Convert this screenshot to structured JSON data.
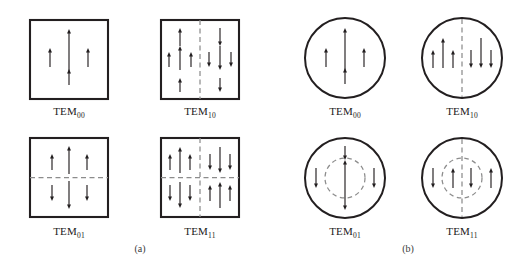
{
  "figure": {
    "panels": [
      {
        "id": "panel-a",
        "caption": "(a)",
        "caption_x": 140,
        "caption_y": 252,
        "aperture": "square",
        "cells": [
          {
            "id": "sq-tem00",
            "label_main": "TEM",
            "label_sub": "00",
            "label_x": 69,
            "label_y": 115,
            "shape": {
              "type": "rect",
              "x": 30,
              "y": 20,
              "w": 78,
              "h": 79
            },
            "nodal_lines": [],
            "nodal_circles": [],
            "arrows": [
              {
                "x": 69,
                "y1": 85,
                "y2": 69,
                "dir": "up",
                "len": 16
              },
              {
                "x": 69,
                "y1": 71,
                "y2": 29,
                "dir": "up",
                "len": 42
              },
              {
                "x": 50,
                "y1": 67,
                "y2": 48,
                "dir": "up",
                "len": 19
              },
              {
                "x": 88,
                "y1": 67,
                "y2": 48,
                "dir": "up",
                "len": 19
              }
            ]
          },
          {
            "id": "sq-tem10",
            "label_main": "TEM",
            "label_sub": "10",
            "label_x": 200,
            "label_y": 115,
            "shape": {
              "type": "rect",
              "x": 161,
              "y": 20,
              "w": 78,
              "h": 79
            },
            "nodal_lines": [
              {
                "orientation": "vertical",
                "x1": 200,
                "y1": 20,
                "x2": 200,
                "y2": 99
              }
            ],
            "nodal_circles": [],
            "arrows": [
              {
                "x": 180,
                "y1": 46,
                "y2": 28,
                "dir": "up",
                "len": 18
              },
              {
                "x": 180,
                "y1": 70,
                "y2": 46,
                "dir": "up",
                "len": 24
              },
              {
                "x": 180,
                "y1": 92,
                "y2": 78,
                "dir": "up",
                "len": 14
              },
              {
                "x": 169,
                "y1": 67,
                "y2": 52,
                "dir": "up",
                "len": 15
              },
              {
                "x": 191,
                "y1": 67,
                "y2": 52,
                "dir": "up",
                "len": 15
              },
              {
                "x": 220,
                "y1": 28,
                "y2": 46,
                "dir": "down",
                "len": 18
              },
              {
                "x": 220,
                "y1": 46,
                "y2": 70,
                "dir": "down",
                "len": 24
              },
              {
                "x": 220,
                "y1": 78,
                "y2": 92,
                "dir": "down",
                "len": 14
              },
              {
                "x": 209,
                "y1": 52,
                "y2": 67,
                "dir": "down",
                "len": 15
              },
              {
                "x": 231,
                "y1": 52,
                "y2": 67,
                "dir": "down",
                "len": 15
              }
            ]
          },
          {
            "id": "sq-tem01",
            "label_main": "TEM",
            "label_sub": "01",
            "label_x": 69,
            "label_y": 235,
            "shape": {
              "type": "rect",
              "x": 30,
              "y": 138,
              "w": 78,
              "h": 79
            },
            "nodal_lines": [
              {
                "orientation": "horizontal",
                "x1": 30,
                "y1": 177.5,
                "x2": 108,
                "y2": 177.5
              }
            ],
            "nodal_circles": [],
            "arrows": [
              {
                "x": 69,
                "y1": 174,
                "y2": 146,
                "dir": "up",
                "len": 28
              },
              {
                "x": 52,
                "y1": 170,
                "y2": 154,
                "dir": "up",
                "len": 16
              },
              {
                "x": 87,
                "y1": 170,
                "y2": 154,
                "dir": "up",
                "len": 16
              },
              {
                "x": 69,
                "y1": 181,
                "y2": 209,
                "dir": "down",
                "len": 28
              },
              {
                "x": 52,
                "y1": 185,
                "y2": 201,
                "dir": "down",
                "len": 16
              },
              {
                "x": 87,
                "y1": 185,
                "y2": 201,
                "dir": "down",
                "len": 16
              }
            ]
          },
          {
            "id": "sq-tem11",
            "label_main": "TEM",
            "label_sub": "11",
            "label_x": 200,
            "label_y": 235,
            "shape": {
              "type": "rect",
              "x": 161,
              "y": 138,
              "w": 78,
              "h": 79
            },
            "nodal_lines": [
              {
                "orientation": "horizontal",
                "x1": 161,
                "y1": 177.5,
                "x2": 239,
                "y2": 177.5
              },
              {
                "orientation": "vertical",
                "x1": 200,
                "y1": 138,
                "x2": 200,
                "y2": 217
              }
            ],
            "nodal_circles": [],
            "arrows": [
              {
                "x": 180,
                "y1": 173,
                "y2": 147,
                "dir": "up",
                "len": 26
              },
              {
                "x": 170,
                "y1": 170,
                "y2": 154,
                "dir": "up",
                "len": 16
              },
              {
                "x": 190,
                "y1": 170,
                "y2": 154,
                "dir": "up",
                "len": 16
              },
              {
                "x": 220,
                "y1": 147,
                "y2": 173,
                "dir": "down",
                "len": 26
              },
              {
                "x": 210,
                "y1": 154,
                "y2": 170,
                "dir": "down",
                "len": 16
              },
              {
                "x": 230,
                "y1": 154,
                "y2": 170,
                "dir": "down",
                "len": 16
              },
              {
                "x": 180,
                "y1": 182,
                "y2": 208,
                "dir": "down",
                "len": 26
              },
              {
                "x": 170,
                "y1": 185,
                "y2": 201,
                "dir": "down",
                "len": 16
              },
              {
                "x": 190,
                "y1": 185,
                "y2": 201,
                "dir": "down",
                "len": 16
              },
              {
                "x": 220,
                "y1": 208,
                "y2": 182,
                "dir": "up",
                "len": 26
              },
              {
                "x": 210,
                "y1": 201,
                "y2": 185,
                "dir": "up",
                "len": 16
              },
              {
                "x": 230,
                "y1": 201,
                "y2": 185,
                "dir": "up",
                "len": 16
              }
            ]
          }
        ]
      },
      {
        "id": "panel-b",
        "caption": "(b)",
        "caption_x": 408,
        "caption_y": 252,
        "aperture": "circular",
        "cells": [
          {
            "id": "ci-tem00",
            "label_main": "TEM",
            "label_sub": "00",
            "label_x": 345,
            "label_y": 115,
            "shape": {
              "type": "circle",
              "cx": 345,
              "cy": 58,
              "r": 40
            },
            "nodal_lines": [],
            "nodal_circles": [],
            "arrows": [
              {
                "x": 345,
                "y1": 84,
                "y2": 68,
                "dir": "up",
                "len": 16
              },
              {
                "x": 345,
                "y1": 70,
                "y2": 28,
                "dir": "up",
                "len": 42
              },
              {
                "x": 326,
                "y1": 67,
                "y2": 48,
                "dir": "up",
                "len": 19
              },
              {
                "x": 364,
                "y1": 67,
                "y2": 48,
                "dir": "up",
                "len": 19
              }
            ]
          },
          {
            "id": "ci-tem10",
            "label_main": "TEM",
            "label_sub": "10",
            "label_x": 462,
            "label_y": 115,
            "shape": {
              "type": "circle",
              "cx": 462,
              "cy": 58,
              "r": 40
            },
            "nodal_lines": [
              {
                "orientation": "vertical",
                "x1": 462,
                "y1": 19,
                "x2": 462,
                "y2": 97
              }
            ],
            "nodal_circles": [],
            "arrows": [
              {
                "x": 443,
                "y1": 68,
                "y2": 38,
                "dir": "up",
                "len": 30
              },
              {
                "x": 433,
                "y1": 68,
                "y2": 50,
                "dir": "up",
                "len": 18
              },
              {
                "x": 453,
                "y1": 68,
                "y2": 50,
                "dir": "up",
                "len": 18
              },
              {
                "x": 481,
                "y1": 38,
                "y2": 68,
                "dir": "down",
                "len": 30
              },
              {
                "x": 471,
                "y1": 50,
                "y2": 68,
                "dir": "down",
                "len": 18
              },
              {
                "x": 491,
                "y1": 50,
                "y2": 68,
                "dir": "down",
                "len": 18
              }
            ]
          },
          {
            "id": "ci-tem01",
            "label_main": "TEM",
            "label_sub": "01",
            "label_x": 345,
            "label_y": 235,
            "shape": {
              "type": "circle",
              "cx": 345,
              "cy": 178,
              "r": 40
            },
            "nodal_lines": [],
            "nodal_circles": [
              {
                "cx": 345,
                "cy": 178,
                "r": 20
              }
            ],
            "arrows": [
              {
                "x": 345,
                "y1": 196,
                "y2": 160,
                "dir": "up",
                "len": 36
              },
              {
                "x": 345,
                "y1": 146,
                "y2": 160,
                "dir": "down",
                "len": 14
              },
              {
                "x": 345,
                "y1": 196,
                "y2": 210,
                "dir": "down",
                "len": 14
              },
              {
                "x": 316,
                "y1": 168,
                "y2": 188,
                "dir": "down",
                "len": 20
              },
              {
                "x": 374,
                "y1": 168,
                "y2": 188,
                "dir": "down",
                "len": 20
              }
            ]
          },
          {
            "id": "ci-tem11",
            "label_main": "TEM",
            "label_sub": "11",
            "label_x": 462,
            "label_y": 235,
            "shape": {
              "type": "circle",
              "cx": 462,
              "cy": 178,
              "r": 40
            },
            "nodal_lines": [
              {
                "orientation": "vertical",
                "x1": 462,
                "y1": 139,
                "x2": 462,
                "y2": 217
              }
            ],
            "nodal_circles": [
              {
                "cx": 462,
                "cy": 178,
                "r": 20
              }
            ],
            "arrows": [
              {
                "x": 453,
                "y1": 188,
                "y2": 168,
                "dir": "up",
                "len": 20
              },
              {
                "x": 471,
                "y1": 168,
                "y2": 188,
                "dir": "down",
                "len": 20
              },
              {
                "x": 433,
                "y1": 168,
                "y2": 188,
                "dir": "down",
                "len": 20
              },
              {
                "x": 491,
                "y1": 188,
                "y2": 168,
                "dir": "up",
                "len": 20
              }
            ]
          }
        ]
      }
    ]
  },
  "style": {
    "frame_color": "#231f20",
    "nodal_color": "#8c8c8c",
    "arrow_color": "#231f20",
    "background": "#ffffff"
  }
}
